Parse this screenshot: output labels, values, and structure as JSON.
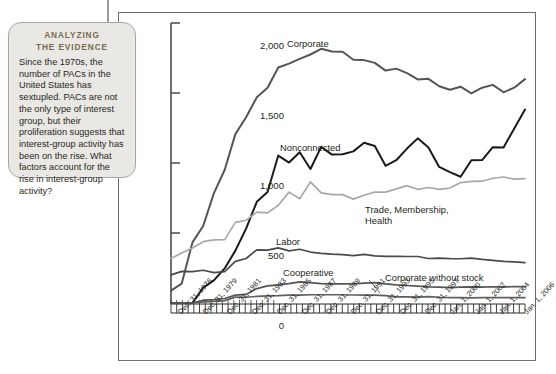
{
  "callout": {
    "title_line1": "ANALYZING",
    "title_line2": "THE EVIDENCE",
    "body": "Since the 1970s, the number of PACs in the United States has sextupled. PACs are not the only type of interest group, but their proliferation suggests that interest-group activity has been on the rise. What factors account for the rise in interest-group activity?",
    "bg_color": "#e9e8e4",
    "title_color": "#7a6a4f"
  },
  "chart_data": {
    "type": "line",
    "title": "",
    "xlabel": "",
    "ylabel": "NUMBER OF PACS",
    "ylim": [
      0,
      2000
    ],
    "yticks": [
      0,
      500,
      1000,
      1500,
      2000
    ],
    "ytick_labels": [
      "0",
      "500",
      "1,000",
      "1,500",
      "2,000"
    ],
    "grid": false,
    "legend": "inline-labels",
    "x_tick_labels": [
      "Dec. 31, 1976",
      "Dec. 31, 1979",
      "Dec. 31, 1981",
      "Dec. 31, 1983",
      "Dec. 31, 1985",
      "Dec. 31, 1987",
      "Dec. 31, 1989",
      "Dec. 31, 1991",
      "Dec. 31, 1993",
      "Dec. 31, 1995",
      "Dec. 31, 1997",
      "Jan. 1, 2000",
      "Jan. 1, 2002",
      "Jan. 1, 2004",
      "Jan. 1, 2006"
    ],
    "x": [
      1974,
      1975,
      1976,
      1977,
      1978,
      1979,
      1980,
      1981,
      1982,
      1983,
      1984,
      1985,
      1986,
      1987,
      1988,
      1989,
      1990,
      1991,
      1992,
      1993,
      1994,
      1995,
      1996,
      1997,
      1998,
      1999,
      2000,
      2001,
      2002,
      2003,
      2004,
      2005,
      2006,
      2007
    ],
    "series": [
      {
        "name": "Corporate",
        "color": "#555555",
        "values": [
          89,
          139,
          433,
          550,
          785,
          950,
          1206,
          1327,
          1469,
          1538,
          1682,
          1710,
          1744,
          1775,
          1816,
          1796,
          1795,
          1738,
          1735,
          1715,
          1660,
          1674,
          1642,
          1597,
          1601,
          1548,
          1523,
          1545,
          1498,
          1538,
          1558,
          1505,
          1538,
          1599
        ]
      },
      {
        "name": "Nonconnected",
        "color": "#1a1a1a",
        "values": [
          0,
          0,
          0,
          110,
          162,
          247,
          374,
          531,
          723,
          793,
          1053,
          1003,
          1077,
          957,
          1115,
          1060,
          1062,
          1083,
          1145,
          1121,
          980,
          1020,
          1103,
          1176,
          1111,
          972,
          935,
          902,
          1020,
          1021,
          1113,
          1111,
          1247,
          1382
        ]
      },
      {
        "name": "Trade, Membership, Health",
        "color": "#a8a8a8",
        "values": [
          318,
          357,
          393,
          438,
          451,
          453,
          576,
          591,
          649,
          644,
          698,
          792,
          745,
          865,
          786,
          774,
          774,
          742,
          770,
          793,
          792,
          815,
          838,
          812,
          825,
          812,
          821,
          860,
          869,
          870,
          891,
          900,
          885,
          888
        ]
      },
      {
        "name": "Labor",
        "color": "#4a4a4a",
        "values": [
          201,
          226,
          224,
          234,
          217,
          224,
          297,
          318,
          380,
          378,
          394,
          372,
          384,
          364,
          354,
          349,
          346,
          338,
          347,
          337,
          333,
          334,
          332,
          332,
          318,
          321,
          317,
          316,
          320,
          311,
          304,
          297,
          294,
          288
        ]
      },
      {
        "name": "Cooperative",
        "color": "#5f5f5f",
        "values": [
          0,
          0,
          0,
          8,
          12,
          17,
          42,
          41,
          47,
          51,
          52,
          56,
          56,
          59,
          59,
          59,
          59,
          57,
          56,
          56,
          53,
          44,
          44,
          42,
          45,
          41,
          39,
          38,
          37,
          38,
          38,
          38,
          39,
          39
        ]
      },
      {
        "name": "Corporate without stock",
        "color": "#555555",
        "values": [
          0,
          0,
          0,
          20,
          24,
          32,
          56,
          61,
          103,
          122,
          130,
          138,
          151,
          145,
          138,
          136,
          136,
          136,
          142,
          146,
          136,
          129,
          125,
          120,
          115,
          114,
          110,
          113,
          115,
          114,
          116,
          114,
          118,
          116
        ]
      }
    ],
    "series_labels": [
      {
        "name": "Corporate",
        "text": "Corporate"
      },
      {
        "name": "Nonconnected",
        "text": "Nonconnected"
      },
      {
        "name": "Trade, Membership, Health",
        "line1": "Trade, Membership,",
        "line2": "Health"
      },
      {
        "name": "Labor",
        "text": "Labor"
      },
      {
        "name": "Cooperative",
        "text": "Cooperative"
      },
      {
        "name": "Corporate without stock",
        "text": "Corporate without stock"
      }
    ]
  }
}
